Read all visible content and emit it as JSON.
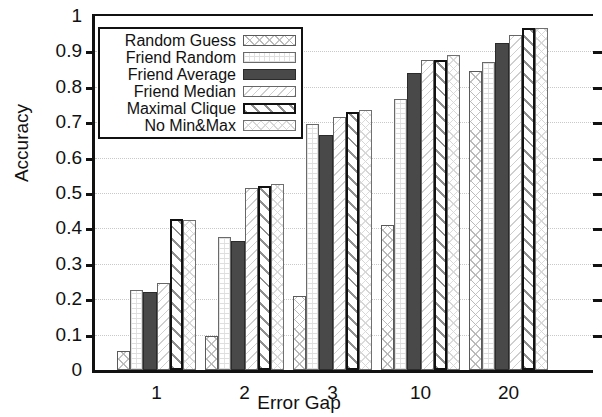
{
  "chart_data": {
    "type": "bar",
    "title": "",
    "xlabel": "Error Gap",
    "ylabel": "Accuracy",
    "categories": [
      "1",
      "2",
      "3",
      "10",
      "20"
    ],
    "ylim": [
      0,
      1
    ],
    "ytick_labels": [
      "0",
      "0.1",
      "0.2",
      "0.3",
      "0.4",
      "0.5",
      "0.6",
      "0.7",
      "0.8",
      "0.9",
      "1"
    ],
    "ytick_values": [
      0,
      0.1,
      0.2,
      0.3,
      0.4,
      0.5,
      0.6,
      0.7,
      0.8,
      0.9,
      1
    ],
    "grid": true,
    "legend_position": "upper-left",
    "series": [
      {
        "name": "Random Guess",
        "pattern": "crosshatch-light",
        "values": [
          0.055,
          0.095,
          0.21,
          0.41,
          0.845
        ]
      },
      {
        "name": "Friend Random",
        "pattern": "dots-faint",
        "values": [
          0.225,
          0.375,
          0.695,
          0.765,
          0.87
        ]
      },
      {
        "name": "Friend Average",
        "pattern": "solid-dark",
        "values": [
          0.22,
          0.365,
          0.665,
          0.84,
          0.925
        ]
      },
      {
        "name": "Friend Median",
        "pattern": "diag-light",
        "values": [
          0.245,
          0.515,
          0.715,
          0.875,
          0.945
        ]
      },
      {
        "name": "Maximal Clique",
        "pattern": "diag-bold",
        "values": [
          0.428,
          0.52,
          0.73,
          0.875,
          0.965
        ]
      },
      {
        "name": "No Min&Max",
        "pattern": "crosshatch-faint",
        "values": [
          0.425,
          0.525,
          0.735,
          0.89,
          0.967
        ]
      }
    ]
  },
  "legend": {
    "items": [
      {
        "label": "Random Guess"
      },
      {
        "label": "Friend Random"
      },
      {
        "label": "Friend Average"
      },
      {
        "label": "Friend Median"
      },
      {
        "label": "Maximal Clique"
      },
      {
        "label": "No Min&Max"
      }
    ]
  }
}
